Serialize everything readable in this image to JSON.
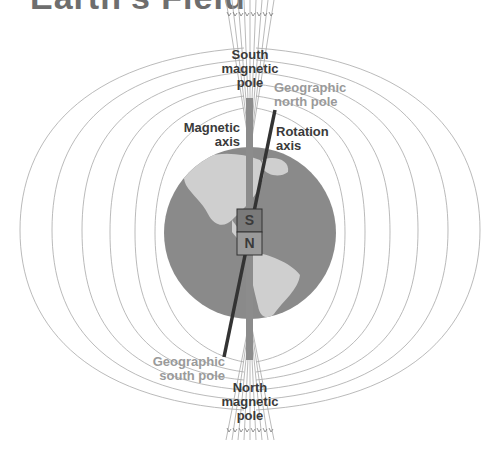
{
  "title": "Earth's Field",
  "colors": {
    "ocean": "#8a8a8a",
    "land": "#cfcfcf",
    "field_line": "#9a9a9a",
    "magnetic_axis": "#8c8c8c",
    "rotation_axis": "#333333",
    "magnet_s": "#7a7a7a",
    "magnet_n": "#9a9a9a",
    "label_dark": "#3a3a3a",
    "label_light": "#9a9a9a"
  },
  "labels": {
    "south_magnetic_pole": [
      "South",
      "magnetic",
      "pole"
    ],
    "geographic_north_pole": [
      "Geographic",
      "north pole"
    ],
    "magnetic_axis": [
      "Magnetic",
      "axis"
    ],
    "rotation_axis": [
      "Rotation",
      "axis"
    ],
    "geographic_south_pole": [
      "Geographic",
      "south pole"
    ],
    "north_magnetic_pole": [
      "North",
      "magnetic",
      "pole"
    ]
  },
  "magnet": {
    "top_pole": "S",
    "bottom_pole": "N"
  },
  "globe": {
    "cx": 250,
    "cy": 233,
    "r": 86
  }
}
